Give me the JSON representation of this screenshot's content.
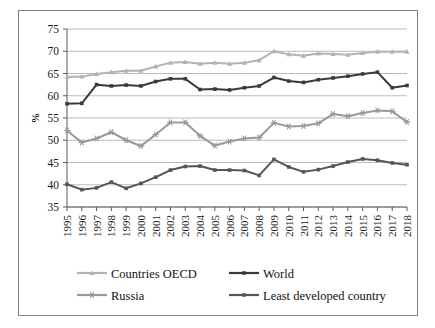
{
  "chart_data": {
    "type": "line",
    "title": "",
    "xlabel": "",
    "ylabel": "%",
    "ylim": [
      35,
      75
    ],
    "yticks": [
      35,
      40,
      45,
      50,
      55,
      60,
      65,
      70,
      75
    ],
    "grid": true,
    "legend_position": "bottom",
    "categories": [
      "1995",
      "1996",
      "1997",
      "1998",
      "1999",
      "2000",
      "2001",
      "2002",
      "2003",
      "2004",
      "2005",
      "2006",
      "2007",
      "2008",
      "2009",
      "2010",
      "2011",
      "2012",
      "2013",
      "2014",
      "2015",
      "2016",
      "2017",
      "2018"
    ],
    "series": [
      {
        "name": "Countries OECD",
        "color": "#b3b3b3",
        "marker": "triangle",
        "values": [
          64.2,
          64.3,
          64.9,
          65.3,
          65.6,
          65.6,
          66.6,
          67.4,
          67.6,
          67.2,
          67.4,
          67.2,
          67.4,
          68.0,
          70.0,
          69.3,
          69.0,
          69.5,
          69.4,
          69.2,
          69.6,
          69.9,
          69.9,
          69.9
        ]
      },
      {
        "name": "World",
        "color": "#3a3a3a",
        "marker": "square",
        "values": [
          58.2,
          58.3,
          62.5,
          62.2,
          62.4,
          62.2,
          63.2,
          63.8,
          63.8,
          61.4,
          61.5,
          61.3,
          61.8,
          62.2,
          64.1,
          63.3,
          63.0,
          63.6,
          64.0,
          64.4,
          64.9,
          65.3,
          61.8,
          62.3
        ]
      },
      {
        "name": "Russia",
        "color": "#999999",
        "marker": "star",
        "values": [
          52.2,
          49.5,
          50.4,
          51.8,
          50.0,
          48.7,
          51.3,
          54.0,
          54.0,
          51.0,
          48.8,
          49.7,
          50.4,
          50.6,
          53.9,
          53.1,
          53.2,
          53.8,
          55.9,
          55.4,
          56.1,
          56.7,
          56.5,
          54.1
        ]
      },
      {
        "name": "Least developed country",
        "color": "#555555",
        "marker": "square",
        "values": [
          40.1,
          38.9,
          39.3,
          40.6,
          39.2,
          40.3,
          41.7,
          43.3,
          44.1,
          44.2,
          43.3,
          43.3,
          43.2,
          42.1,
          45.7,
          44.0,
          42.9,
          43.4,
          44.2,
          45.1,
          45.8,
          45.5,
          44.9,
          44.5
        ]
      }
    ]
  },
  "axis": {
    "y_label": "%"
  },
  "legend": {
    "items": [
      {
        "label": "Countries OECD"
      },
      {
        "label": "World"
      },
      {
        "label": "Russia"
      },
      {
        "label": "Least developed country"
      }
    ]
  }
}
